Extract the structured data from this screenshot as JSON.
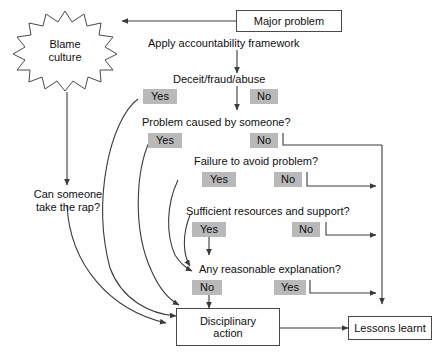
{
  "diagram": {
    "background_color": "#fefefe",
    "line_color": "#4a4a4a",
    "badge_color": "#b9b9b9",
    "text_color": "#101010"
  },
  "nodes": {
    "major_problem": "Major problem",
    "blame_culture_line1": "Blame",
    "blame_culture_line2": "culture",
    "apply_framework": "Apply accountability framework",
    "deceit": "Deceit/fraud/abuse",
    "problem_caused": "Problem caused by someone?",
    "failure_to_avoid": "Failure to avoid problem?",
    "sufficient_resources": "Sufficient resources and support?",
    "reasonable_explanation": "Any reasonable explanation?",
    "can_someone_line1": "Can someone",
    "can_someone_line2": "take the rap?",
    "disciplinary_line1": "Disciplinary",
    "disciplinary_line2": "action",
    "lessons_learnt": "Lessons learnt"
  },
  "decisions": [
    {
      "question": "Deceit/fraud/abuse",
      "left_label": "Yes",
      "right_label": "No"
    },
    {
      "question": "Problem caused by someone?",
      "left_label": "Yes",
      "right_label": "No"
    },
    {
      "question": "Failure to avoid problem?",
      "left_label": "Yes",
      "right_label": "No"
    },
    {
      "question": "Sufficient resources and support?",
      "left_label": "Yes",
      "right_label": "No"
    },
    {
      "question": "Any reasonable explanation?",
      "left_label": "No",
      "right_label": "Yes"
    }
  ],
  "badges": {
    "deceit_yes": "Yes",
    "deceit_no": "No",
    "caused_yes": "Yes",
    "caused_no": "No",
    "failure_yes": "Yes",
    "failure_no": "No",
    "resources_yes": "Yes",
    "resources_no": "No",
    "explanation_no": "No",
    "explanation_yes": "Yes"
  }
}
